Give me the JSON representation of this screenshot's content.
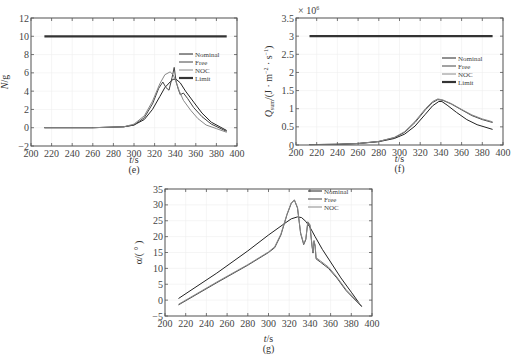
{
  "chart_data": [
    {
      "id": "e",
      "type": "line",
      "caption": "(e)",
      "xlabel": "t/s",
      "ylabel": "N/g",
      "xlim": [
        200,
        400
      ],
      "ylim": [
        -2,
        12
      ],
      "xticks": [
        200,
        220,
        240,
        260,
        280,
        300,
        320,
        340,
        360,
        380,
        400
      ],
      "yticks": [
        -2,
        0,
        2,
        4,
        6,
        8,
        10,
        12
      ],
      "grid": true,
      "legend": {
        "position": "right-middle",
        "entries": [
          "Nominal",
          "Free",
          "NOC",
          "Limit"
        ]
      },
      "series": [
        {
          "name": "Nominal",
          "color": "#222222",
          "width": 1,
          "x": [
            213,
            260,
            290,
            300,
            310,
            318,
            325,
            330,
            335,
            338,
            341,
            345,
            350,
            358,
            366,
            375,
            390
          ],
          "y": [
            0,
            0,
            0.1,
            0.3,
            0.9,
            2.0,
            3.4,
            4.4,
            5.0,
            5.3,
            5.3,
            4.9,
            4.0,
            2.8,
            1.6,
            0.6,
            -0.3
          ]
        },
        {
          "name": "Free",
          "color": "#444444",
          "width": 1,
          "x": [
            213,
            260,
            290,
            300,
            310,
            318,
            324,
            328,
            331,
            334,
            337,
            339,
            341,
            343,
            345,
            348,
            352,
            358,
            366,
            375,
            390
          ],
          "y": [
            0,
            0,
            0.1,
            0.3,
            1.1,
            2.6,
            4.3,
            5.0,
            4.4,
            4.1,
            5.5,
            6.6,
            5.0,
            4.2,
            3.6,
            3.8,
            3.2,
            2.2,
            1.2,
            0.4,
            -0.4
          ]
        },
        {
          "name": "NOC",
          "color": "#888888",
          "width": 1,
          "x": [
            213,
            260,
            290,
            300,
            310,
            318,
            325,
            330,
            335,
            338,
            341,
            344,
            348,
            355,
            362,
            370,
            380,
            390
          ],
          "y": [
            0,
            0,
            0.1,
            0.4,
            1.3,
            2.9,
            4.8,
            5.8,
            6.1,
            5.8,
            5.0,
            4.0,
            3.0,
            1.9,
            1.0,
            0.3,
            -0.1,
            -0.5
          ]
        },
        {
          "name": "Limit",
          "color": "#333333",
          "width": 2.2,
          "x": [
            213,
            390
          ],
          "y": [
            10,
            10
          ]
        }
      ]
    },
    {
      "id": "f",
      "type": "line",
      "caption": "(f)",
      "xlabel": "t/s",
      "ylabel": "Q_sum/(J·m⁻²·s⁻¹)",
      "ylabel_main": "Q",
      "ylabel_sub": "sum",
      "ylabel_rest": "/(J · m",
      "ylabel_sup1": "−2",
      "ylabel_mid": " · s",
      "ylabel_sup2": "−1",
      "ylabel_end": ")",
      "scale_label": "× 10",
      "scale_exp": "6",
      "xlim": [
        200,
        400
      ],
      "ylim": [
        0,
        3.5
      ],
      "xticks": [
        200,
        220,
        240,
        260,
        280,
        300,
        320,
        340,
        360,
        380,
        400
      ],
      "yticks": [
        0,
        0.5,
        1,
        1.5,
        2,
        2.5,
        3,
        3.5
      ],
      "grid": true,
      "legend": {
        "position": "right-middle",
        "entries": [
          "Nominal",
          "Free",
          "NOC",
          "Limit"
        ]
      },
      "series": [
        {
          "name": "Nominal",
          "color": "#222222",
          "width": 1,
          "x": [
            213,
            240,
            260,
            280,
            295,
            305,
            315,
            325,
            332,
            338,
            341,
            346,
            355,
            365,
            375,
            390
          ],
          "y": [
            0.01,
            0.02,
            0.04,
            0.09,
            0.18,
            0.3,
            0.52,
            0.85,
            1.08,
            1.2,
            1.2,
            1.1,
            0.9,
            0.7,
            0.56,
            0.43
          ]
        },
        {
          "name": "Free",
          "color": "#444444",
          "width": 1,
          "x": [
            213,
            240,
            260,
            280,
            295,
            305,
            315,
            325,
            332,
            337,
            342,
            350,
            360,
            370,
            380,
            390
          ],
          "y": [
            0.01,
            0.02,
            0.04,
            0.1,
            0.2,
            0.35,
            0.62,
            0.97,
            1.17,
            1.25,
            1.23,
            1.13,
            0.97,
            0.81,
            0.7,
            0.62
          ]
        },
        {
          "name": "NOC",
          "color": "#888888",
          "width": 1,
          "x": [
            213,
            240,
            260,
            280,
            295,
            305,
            315,
            325,
            332,
            337,
            342,
            350,
            360,
            370,
            380,
            390
          ],
          "y": [
            0.01,
            0.02,
            0.04,
            0.1,
            0.21,
            0.37,
            0.65,
            1.0,
            1.2,
            1.27,
            1.24,
            1.14,
            0.98,
            0.83,
            0.72,
            0.64
          ]
        },
        {
          "name": "Limit",
          "color": "#333333",
          "width": 2.2,
          "x": [
            213,
            390
          ],
          "y": [
            3,
            3
          ]
        }
      ]
    },
    {
      "id": "g",
      "type": "line",
      "caption": "(g)",
      "xlabel": "t/s",
      "ylabel": "α/(°)",
      "xlim": [
        200,
        400
      ],
      "ylim": [
        -5,
        35
      ],
      "xticks": [
        200,
        220,
        240,
        260,
        280,
        300,
        320,
        340,
        360,
        380,
        400
      ],
      "yticks": [
        -5,
        0,
        5,
        10,
        15,
        20,
        25,
        30,
        35
      ],
      "grid": true,
      "legend": {
        "position": "upper-right",
        "entries": [
          "Nominal",
          "Free",
          "NOC"
        ]
      },
      "series": [
        {
          "name": "Nominal",
          "color": "#222222",
          "width": 1,
          "x": [
            213,
            250,
            280,
            300,
            315,
            322,
            328,
            332,
            336,
            340,
            345,
            352,
            360,
            370,
            380,
            390
          ],
          "y": [
            0.5,
            8.5,
            15.5,
            20.5,
            24.0,
            25.6,
            26.2,
            26.0,
            24.8,
            23.0,
            20.0,
            16.0,
            12.0,
            7.0,
            2.5,
            -2.0
          ]
        },
        {
          "name": "Free",
          "color": "#444444",
          "width": 1,
          "x": [
            213,
            250,
            280,
            300,
            306,
            312,
            318,
            322,
            325,
            328,
            331,
            334,
            336,
            338,
            340,
            342,
            343,
            344,
            345,
            346,
            350,
            358,
            366,
            375,
            390
          ],
          "y": [
            -1.5,
            5.5,
            11.0,
            15.0,
            16.5,
            20.5,
            27.0,
            30.5,
            31.5,
            29.0,
            21.0,
            17.5,
            19.0,
            24.5,
            23.5,
            17.0,
            14.8,
            18.5,
            17.0,
            13.0,
            12.0,
            10.0,
            7.0,
            3.0,
            -2.0
          ]
        },
        {
          "name": "NOC",
          "color": "#888888",
          "width": 1,
          "x": [
            213,
            250,
            280,
            300,
            306,
            312,
            318,
            322,
            325,
            328,
            331,
            334,
            336,
            338,
            340,
            342,
            343,
            344,
            345,
            346,
            350,
            358,
            366,
            375,
            390
          ],
          "y": [
            -1.3,
            5.7,
            11.2,
            15.2,
            16.8,
            20.8,
            27.2,
            30.7,
            31.6,
            29.2,
            21.3,
            17.8,
            19.3,
            24.7,
            23.8,
            17.3,
            15.1,
            18.8,
            17.3,
            13.4,
            12.4,
            10.4,
            7.3,
            3.3,
            -1.8
          ]
        }
      ]
    }
  ]
}
